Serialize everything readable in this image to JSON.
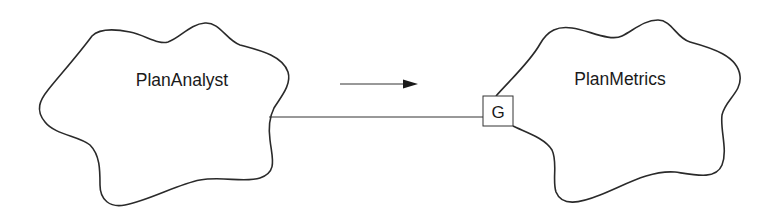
{
  "diagram": {
    "nodes": [
      {
        "id": "plan-analyst",
        "label": "PlanAnalyst",
        "shape": "cloud"
      },
      {
        "id": "plan-metrics",
        "label": "PlanMetrics",
        "shape": "cloud"
      }
    ],
    "gate": {
      "label": "G",
      "attached_to": "plan-metrics"
    },
    "edges": [
      {
        "from": "plan-analyst",
        "to": "plan-metrics",
        "via": "G",
        "style": "line"
      }
    ],
    "direction_arrow": {
      "direction": "right",
      "meaning": "flow from PlanAnalyst to PlanMetrics"
    },
    "colors": {
      "stroke": "#2a2a2a",
      "background": "#ffffff"
    }
  }
}
